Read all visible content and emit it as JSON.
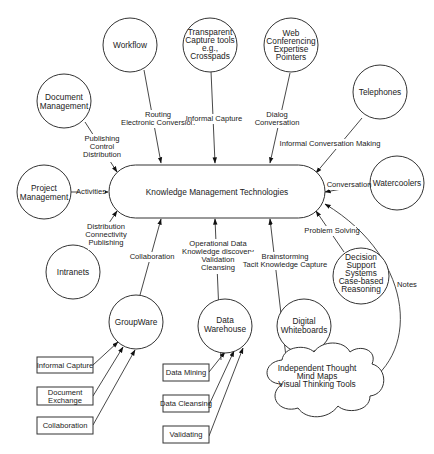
{
  "center": {
    "label": "Knowledge Management Technologies"
  },
  "nodes": {
    "workflow": {
      "lines": [
        "Workflow"
      ]
    },
    "transparent_capture": {
      "lines": [
        "Transparent",
        "Capture tools",
        "e.g.,",
        "Crosspads"
      ]
    },
    "web_conferencing": {
      "lines": [
        "Web",
        "Conferencing",
        "Expertise",
        "Pointers"
      ]
    },
    "document_management": {
      "lines": [
        "Document",
        "Management"
      ]
    },
    "telephones": {
      "lines": [
        "Telephones"
      ]
    },
    "project_management": {
      "lines": [
        "Project",
        "Management"
      ]
    },
    "watercoolers": {
      "lines": [
        "Watercoolers"
      ]
    },
    "intranets": {
      "lines": [
        "Intranets"
      ]
    },
    "decision_support": {
      "lines": [
        "Decision",
        "Support",
        "Systems",
        "Case-based",
        "Reasoning"
      ]
    },
    "groupware": {
      "lines": [
        "GroupWare"
      ]
    },
    "data_warehouse": {
      "lines": [
        "Data",
        "Warehouse"
      ]
    },
    "digital_whiteboards": {
      "lines": [
        "Digital",
        "Whiteboards"
      ]
    },
    "independent_thought": {
      "lines": [
        "Independent Thought",
        "Mind Maps",
        "Visual Thinking Tools"
      ]
    }
  },
  "groupware_inputs": [
    "Informal Capture",
    [
      "Document",
      "Exchange"
    ],
    "Collaboration"
  ],
  "warehouse_inputs": [
    "Data Mining",
    "Data Cleansing",
    "Validating"
  ],
  "edge_labels": {
    "workflow": [
      "Routing",
      "Electronic Conversion"
    ],
    "transparent_capture": [
      "Informal Capture"
    ],
    "web_conferencing": [
      "Dialog",
      "Conversation"
    ],
    "document_management": [
      "Publishing",
      "Control",
      "Distribution"
    ],
    "telephones": [
      "Informal Conversation Making"
    ],
    "project_management": [
      "Activities"
    ],
    "watercoolers": [
      "Conversation"
    ],
    "intranets": [
      "Distribution",
      "Connectivity",
      "Publishing"
    ],
    "decision_support": [
      "Problem Solving"
    ],
    "groupware": [
      "Collaboration"
    ],
    "data_warehouse": [
      "Operational Data",
      "Knowledge discovery",
      "Validation",
      "Cleansing"
    ],
    "digital_whiteboards": [
      "Brainstorming",
      "Tacit Knowledge Capture"
    ],
    "independent_thought": [
      "Notes"
    ]
  }
}
